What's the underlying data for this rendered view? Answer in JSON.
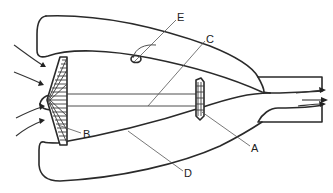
{
  "diagram": {
    "labels": [
      {
        "id": "A",
        "text": "A",
        "points_to": "turbine"
      },
      {
        "id": "B",
        "text": "B",
        "points_to": "fan"
      },
      {
        "id": "C",
        "text": "C",
        "points_to": "shaft"
      },
      {
        "id": "D",
        "text": "D",
        "points_to": "bypass-duct"
      },
      {
        "id": "E",
        "text": "E",
        "points_to": "fuel-injector"
      }
    ],
    "colors": {
      "line": "#2a2a2a",
      "background": "#ffffff"
    }
  }
}
